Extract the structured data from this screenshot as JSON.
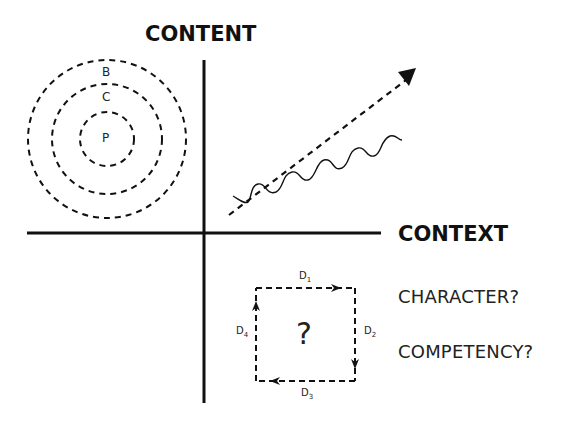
{
  "axes": {
    "vertical_label": "CONTENT",
    "horizontal_label": "CONTEXT"
  },
  "circles": {
    "labels": [
      "B",
      "C",
      "P"
    ]
  },
  "cycle": {
    "center_symbol": "?",
    "edges": [
      {
        "label": "D",
        "sub": "1"
      },
      {
        "label": "D",
        "sub": "2"
      },
      {
        "label": "D",
        "sub": "3"
      },
      {
        "label": "D",
        "sub": "4"
      }
    ]
  },
  "questions": [
    "CHARACTER?",
    "COMPETENCY?"
  ],
  "colors": {
    "ink": "#111111",
    "background": "#ffffff"
  }
}
